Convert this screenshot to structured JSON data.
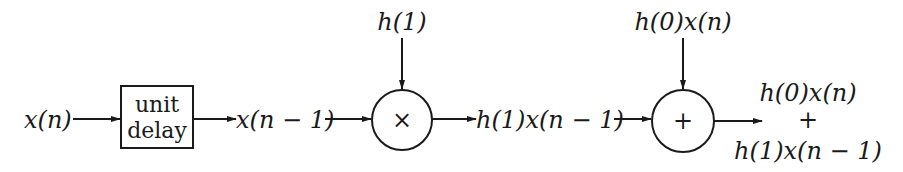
{
  "diagram": {
    "type": "signal-flow block diagram",
    "input_label": "x(n)",
    "delay_block": {
      "line1": "unit",
      "line2": "delay"
    },
    "delayed_signal_label": "x(n − 1)",
    "multiplier": {
      "symbol": "×",
      "coefficient_label": "h(1)"
    },
    "product_label": "h(1)x(n − 1)",
    "adder": {
      "symbol": "+",
      "side_input_label": "h(0)x(n)"
    },
    "output": {
      "line1": "h(0)x(n)",
      "line2": "+",
      "line3": "h(1)x(n − 1)"
    },
    "colors": {
      "ink": "#1a1a1a",
      "background": "#ffffff"
    }
  }
}
